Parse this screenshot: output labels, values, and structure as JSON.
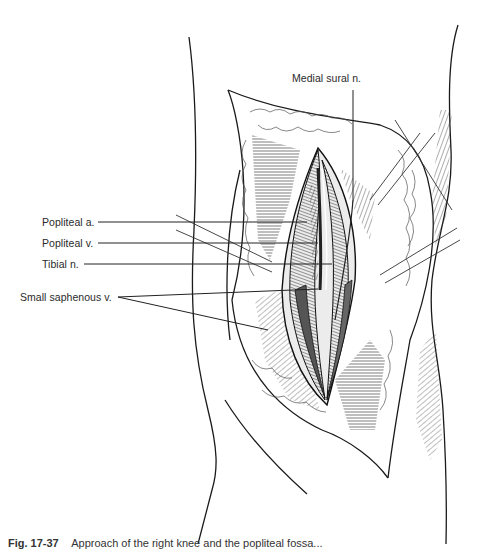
{
  "figure": {
    "labels": {
      "medial_sural": "Medial sural n.",
      "popliteal_artery": "Popliteal a.",
      "popliteal_vein": "Popliteal v.",
      "tibial_nerve": "Tibial n.",
      "small_saphenous": "Small saphenous v."
    },
    "caption": {
      "number": "Fig. 17-37",
      "text": "Approach of the right knee and the popliteal fossa..."
    },
    "colors": {
      "ink": "#1a1a1a",
      "leader": "#222222",
      "background": "#ffffff"
    }
  }
}
